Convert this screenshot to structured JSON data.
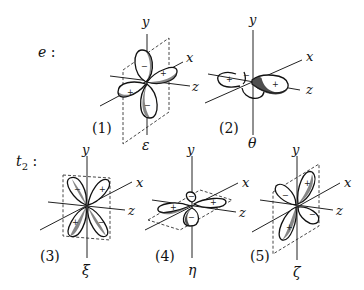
{
  "figure": {
    "groups": [
      {
        "label": "e :",
        "label_symbol": "e",
        "orbitals": [
          {
            "index": "(1)",
            "symbol": "ε",
            "axes": {
              "y": "y",
              "x": "x",
              "z": "z"
            },
            "lobe_signs": [
              "−",
              "+",
              "+",
              "−"
            ],
            "plane": "xy"
          },
          {
            "index": "(2)",
            "symbol": "θ",
            "axes": {
              "y": "y",
              "x": "x",
              "z": "z"
            },
            "lobe_signs": [
              "+",
              "+",
              "−"
            ],
            "plane": "none"
          }
        ]
      },
      {
        "label": "t₂ :",
        "label_symbol": "t",
        "label_subscript": "2",
        "orbitals": [
          {
            "index": "(3)",
            "symbol": "ξ",
            "axes": {
              "y": "y",
              "x": "x",
              "z": "z"
            },
            "lobe_signs": [
              "−",
              "+",
              "+",
              "−"
            ],
            "plane": "yz"
          },
          {
            "index": "(4)",
            "symbol": "η",
            "axes": {
              "y": "y",
              "x": "x",
              "z": "z"
            },
            "lobe_signs": [
              "+",
              "+",
              "−",
              "−"
            ],
            "plane": "zx"
          },
          {
            "index": "(5)",
            "symbol": "ζ",
            "axes": {
              "y": "y",
              "x": "x",
              "z": "z"
            },
            "lobe_signs": [
              "−",
              "+",
              "+",
              "−"
            ],
            "plane": "xy"
          }
        ]
      }
    ]
  }
}
